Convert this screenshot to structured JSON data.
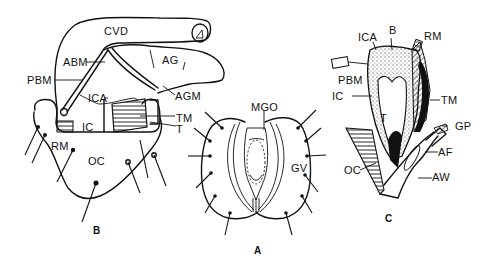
{
  "figure": {
    "type": "anatomical line drawing",
    "colors": {
      "ink": "#111111",
      "background": "#ffffff"
    },
    "panels": [
      {
        "id": "B",
        "caption": "B",
        "labels": [
          "CVD",
          "ABM",
          "AG",
          "PBM",
          "ICA",
          "AGM",
          "IC",
          "TM",
          "T",
          "RM",
          "OC"
        ]
      },
      {
        "id": "A",
        "caption": "A",
        "labels": [
          "MGO",
          "GV"
        ]
      },
      {
        "id": "C",
        "caption": "C",
        "labels": [
          "ICA",
          "B",
          "RM",
          "PBM",
          "IC",
          "TM",
          "T",
          "GP",
          "AF",
          "OC",
          "AW"
        ]
      }
    ]
  },
  "panelB": {
    "caption": "B",
    "cvd": "CVD",
    "abm": "ABM",
    "ag": "AG",
    "pbm": "PBM",
    "ica": "ICA",
    "agm": "AGM",
    "ic": "IC",
    "tm": "TM",
    "t": "T",
    "rm": "RM",
    "oc": "OC"
  },
  "panelA": {
    "caption": "A",
    "mgo": "MGO",
    "gv": "GV"
  },
  "panelC": {
    "caption": "C",
    "ica": "ICA",
    "b": "B",
    "rm": "RM",
    "pbm": "PBM",
    "ic": "IC",
    "tm": "TM",
    "t": "T",
    "gp": "GP",
    "af": "AF",
    "oc": "OC",
    "aw": "AW"
  }
}
